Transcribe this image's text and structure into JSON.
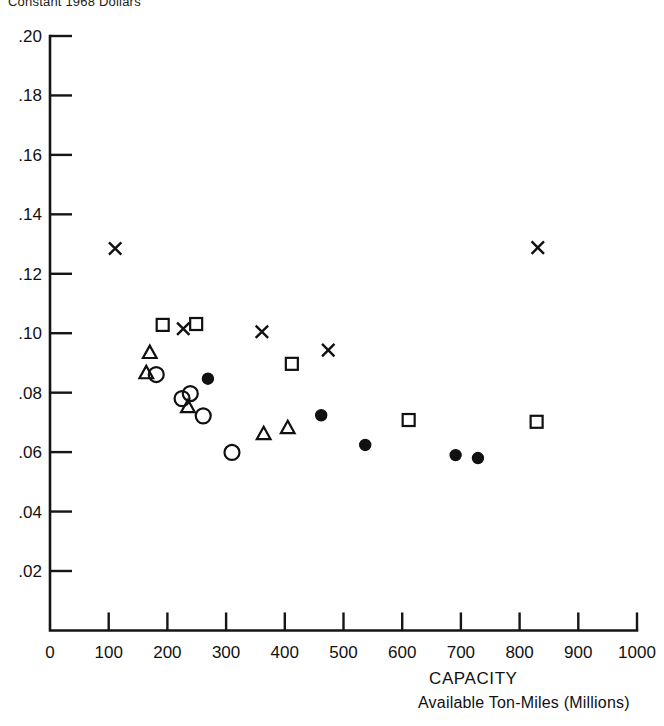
{
  "figure": {
    "top_caption": "Constant 1968 Dollars",
    "xlabel_main": "CAPACITY",
    "xlabel_sub": "Available Ton-Miles (Millions)"
  },
  "axes": {
    "y_ticks": [
      ".20",
      ".18",
      ".16",
      ".14",
      ".12",
      ".10",
      ".08",
      ".06",
      ".04",
      ".02"
    ],
    "x_ticks": [
      "0",
      "100",
      "200",
      "300",
      "400",
      "500",
      "600",
      "700",
      "800",
      "900",
      "1000"
    ]
  },
  "chart_data": {
    "type": "scatter",
    "title": "Constant 1968 Dollars",
    "xlabel": "CAPACITY  Available Ton-Miles (Millions)",
    "ylabel": "",
    "xlim": [
      0,
      1000
    ],
    "ylim": [
      0,
      0.2
    ],
    "xticks": [
      0,
      100,
      200,
      300,
      400,
      500,
      600,
      700,
      800,
      900,
      1000
    ],
    "yticks": [
      0.02,
      0.04,
      0.06,
      0.08,
      0.1,
      0.12,
      0.14,
      0.16,
      0.18,
      0.2
    ],
    "grid": false,
    "legend": "none",
    "series": [
      {
        "name": "cross",
        "marker": "x",
        "points": [
          [
            111,
            0.1285
          ],
          [
            227,
            0.1015
          ],
          [
            361,
            0.1005
          ],
          [
            474,
            0.0943
          ],
          [
            831,
            0.1288
          ]
        ]
      },
      {
        "name": "square",
        "marker": "square-open",
        "points": [
          [
            192,
            0.1028
          ],
          [
            249,
            0.1031
          ],
          [
            412,
            0.0897
          ],
          [
            611,
            0.0708
          ],
          [
            829,
            0.0702
          ]
        ]
      },
      {
        "name": "triangle",
        "marker": "triangle-open",
        "points": [
          [
            170,
            0.0934
          ],
          [
            164,
            0.0866
          ],
          [
            235,
            0.0752
          ],
          [
            364,
            0.0661
          ],
          [
            405,
            0.0681
          ]
        ]
      },
      {
        "name": "circle-open",
        "marker": "circle-open",
        "points": [
          [
            181,
            0.0861
          ],
          [
            225,
            0.078
          ],
          [
            239,
            0.0797
          ],
          [
            261,
            0.0722
          ],
          [
            310,
            0.0599
          ]
        ]
      },
      {
        "name": "circle-filled",
        "marker": "circle-filled",
        "points": [
          [
            269,
            0.0847
          ],
          [
            462,
            0.0724
          ],
          [
            537,
            0.0624
          ],
          [
            691,
            0.059
          ],
          [
            729,
            0.058
          ]
        ]
      }
    ]
  }
}
